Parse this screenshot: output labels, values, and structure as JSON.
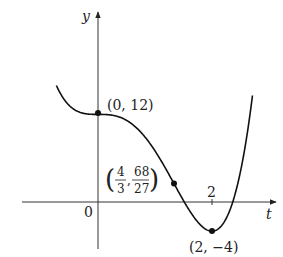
{
  "chart_data": {
    "type": "line",
    "title": "",
    "function": "y = 3t^4 - 8t^3 + 12",
    "xlabel": "t",
    "ylabel": "y",
    "xlim": [
      -0.9,
      2.85
    ],
    "ylim": [
      -6.5,
      31
    ],
    "grid": false,
    "legend": null,
    "tick_labels": {
      "x": [
        "0",
        "2"
      ]
    },
    "points": [
      {
        "t": 0,
        "y": 12,
        "label": "(0, 12)"
      },
      {
        "t": 1.3333,
        "y": 2.5185,
        "label_num": [
          "4",
          "68"
        ],
        "label_den": [
          "3",
          "27"
        ]
      },
      {
        "t": 2,
        "y": -4,
        "label": "(2, -4)"
      }
    ],
    "x": [
      -0.72,
      -0.6,
      -0.5,
      -0.4,
      -0.3,
      -0.2,
      -0.1,
      0,
      0.2,
      0.4,
      0.6,
      0.8,
      1.0,
      1.2,
      1.3333,
      1.5,
      1.7,
      1.9,
      2.0,
      2.2,
      2.4,
      2.6,
      2.7
    ],
    "y": [
      20.3,
      15.62,
      13.19,
      12.59,
      12.24,
      12.05,
      12.01,
      12,
      11.94,
      11.57,
      10.66,
      9.13,
      7.0,
      4.4,
      2.52,
      0.19,
      -2.25,
      -3.78,
      -4,
      -2.05,
      4.85,
      17.7,
      27.98
    ]
  },
  "labels": {
    "y_axis": "y",
    "t_axis": "t",
    "origin": "0",
    "tick_2": "2",
    "p0": "(0, 12)",
    "p2": "(2, −4)",
    "inf_num1": "4",
    "inf_den1": "3",
    "inf_num2": "68",
    "inf_den2": "27",
    "comma": ","
  }
}
